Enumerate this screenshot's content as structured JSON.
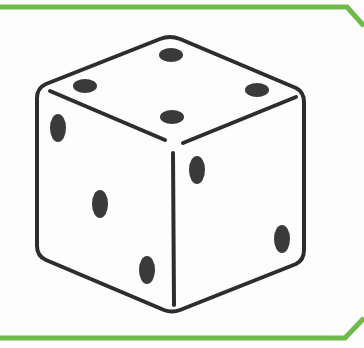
{
  "illustration": {
    "subject": "six-sided die",
    "faces": {
      "top": {
        "pips": 4
      },
      "left": {
        "pips": 3
      },
      "right": {
        "pips": 2
      }
    }
  },
  "colors": {
    "frame": "#6fba4a",
    "outline": "#2d2d2d",
    "pip": "#3a3a3a",
    "background": "#fdfdfd"
  }
}
